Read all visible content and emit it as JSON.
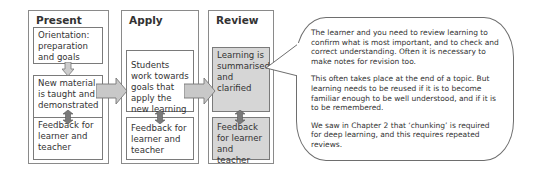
{
  "diagram": {
    "panels": [
      {
        "title": "Present",
        "boxes": [
          {
            "text": "Orientation: preparation and goals",
            "shaded": false
          },
          {
            "text": "New material is taught and demonstrated",
            "shaded": false
          },
          {
            "text": "Feedback for learner and teacher",
            "shaded": false
          }
        ]
      },
      {
        "title": "Apply",
        "boxes": [
          {
            "text": "Students work towards goals that apply the new learning",
            "shaded": false
          },
          {
            "text": "Feedback for learner and teacher",
            "shaded": false
          }
        ]
      },
      {
        "title": "Review",
        "boxes": [
          {
            "text": "Learning is summarised and clarified",
            "shaded": true
          },
          {
            "text": "Feedback for learner and teacher",
            "shaded": true
          }
        ]
      }
    ],
    "callout": {
      "paragraphs": [
        "The learner and you need to review learning to confirm what is most important, and to check and correct understanding.  Often it is necessary to make notes for revision too.",
        "This often takes place at the end of a topic. But learning needs to be reused if it is to become familiar enough to be well understood, and if it is to be remembered.",
        "We saw in Chapter 2 that ‘chunking’ is required for deep learning, and this requires repeated reviews."
      ]
    },
    "colors": {
      "border": "#7a7a7a",
      "shaded_fill": "#d6d6d6",
      "arrow_fill": "#c8c8c8",
      "arrow_dark": "#777777"
    }
  }
}
